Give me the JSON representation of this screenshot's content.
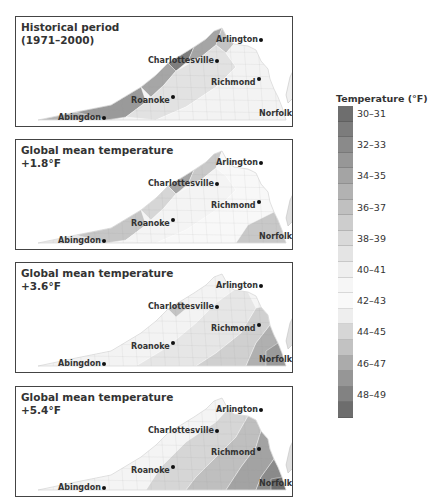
{
  "legend": {
    "title": "Temperature (°F)",
    "labels": [
      "30–31",
      "32–33",
      "34–35",
      "36–37",
      "38–39",
      "40–41",
      "42–43",
      "44–45",
      "46–47",
      "48–49"
    ],
    "band_colors": [
      "#6e6e6e",
      "#7c7c7c",
      "#8a8a8a",
      "#979797",
      "#a4a4a4",
      "#b2b2b2",
      "#c0c0c0",
      "#cdcdcd",
      "#d9d9d9",
      "#e4e4e4",
      "#efefef",
      "#f6f6f6",
      "#f9f9f9",
      "#eeeeee",
      "#d6d6d6",
      "#c2c2c2",
      "#ababab",
      "#969696",
      "#828282",
      "#6d6d6d"
    ]
  },
  "panels": [
    {
      "title_line1": "Historical period",
      "title_line2": "(1971–2000)"
    },
    {
      "title_line1": "Global mean temperature",
      "title_line2": "+1.8°F"
    },
    {
      "title_line1": "Global mean temperature",
      "title_line2": "+3.6°F"
    },
    {
      "title_line1": "Global mean temperature",
      "title_line2": "+5.4°F"
    }
  ],
  "cities": {
    "arlington": "Arlington",
    "charlottesville": "Charlottesville",
    "richmond": "Richmond",
    "roanoke": "Roanoke",
    "abingdon": "Abingdon",
    "norfolk": "Norfolk"
  },
  "chart_data": {
    "type": "heatmap",
    "panels": [
      "Historical period (1971–2000)",
      "Global mean temperature +1.8°F",
      "Global mean temperature +3.6°F",
      "Global mean temperature +5.4°F"
    ],
    "legend_title": "Temperature (°F)",
    "legend_bins": [
      "30–31",
      "32–33",
      "34–35",
      "36–37",
      "38–39",
      "40–41",
      "42–43",
      "44–45",
      "46–47",
      "48–49"
    ],
    "cities": [
      "Arlington",
      "Charlottesville",
      "Richmond",
      "Roanoke",
      "Abingdon",
      "Norfolk"
    ]
  }
}
